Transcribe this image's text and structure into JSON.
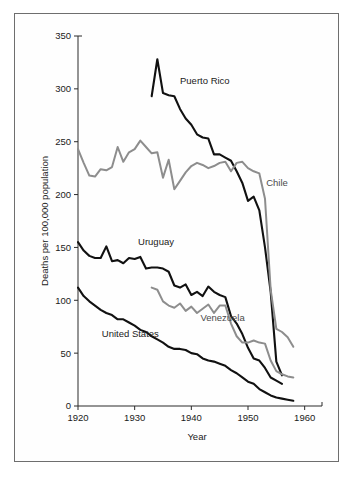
{
  "chart_data": {
    "type": "line",
    "title": "",
    "xlabel": "Year",
    "ylabel": "Deaths per 100,000 population",
    "xlim": [
      1920,
      1962
    ],
    "ylim": [
      0,
      350
    ],
    "xticks": [
      "1920",
      "1930",
      "1940",
      "1950",
      "1960"
    ],
    "xtick_values": [
      1920,
      1930,
      1940,
      1950,
      1960
    ],
    "yticks": [
      "0",
      "50",
      "100",
      "150",
      "200",
      "250",
      "300",
      "350"
    ],
    "ytick_values": [
      0,
      50,
      100,
      150,
      200,
      250,
      300,
      350
    ],
    "grid": false,
    "legend_position": "inline-annotations",
    "annotations": [
      {
        "text": "Puerto Rico",
        "x": 1938.0,
        "y": 305
      },
      {
        "text": "Chile",
        "x": 1953.2,
        "y": 208
      },
      {
        "text": "Uruguay",
        "x": 1930.6,
        "y": 152
      },
      {
        "text": "Venezuela",
        "x": 1941.6,
        "y": 80
      },
      {
        "text": "United States",
        "x": 1924.2,
        "y": 65
      }
    ],
    "series": [
      {
        "name": "Puerto Rico",
        "color": "#111111",
        "x": [
          1933,
          1934,
          1935,
          1936,
          1937,
          1938,
          1939,
          1940,
          1941,
          1942,
          1943,
          1944,
          1945,
          1946,
          1947,
          1948,
          1949,
          1950,
          1951,
          1952,
          1953,
          1954,
          1955,
          1956
        ],
        "values": [
          293,
          328,
          296,
          294,
          293,
          281,
          272,
          266,
          257,
          254,
          253,
          238,
          238,
          235,
          232,
          222,
          211,
          194,
          198,
          185,
          150,
          108,
          42,
          29
        ]
      },
      {
        "name": "Chile",
        "color": "#8d8d8d",
        "x": [
          1920,
          1921,
          1922,
          1923,
          1924,
          1925,
          1926,
          1927,
          1928,
          1929,
          1930,
          1931,
          1932,
          1933,
          1934,
          1935,
          1936,
          1937,
          1938,
          1939,
          1940,
          1941,
          1942,
          1943,
          1944,
          1945,
          1946,
          1947,
          1948,
          1949,
          1950,
          1951,
          1952,
          1953,
          1954,
          1955,
          1956,
          1957,
          1958
        ],
        "values": [
          243,
          230,
          218,
          217,
          224,
          223,
          226,
          245,
          231,
          240,
          243,
          251,
          245,
          239,
          240,
          216,
          233,
          205,
          213,
          221,
          227,
          230,
          228,
          225,
          227,
          230,
          231,
          222,
          230,
          231,
          225,
          222,
          220,
          196,
          110,
          73,
          70,
          65,
          56
        ]
      },
      {
        "name": "Uruguay",
        "color": "#111111",
        "x": [
          1920,
          1921,
          1922,
          1923,
          1924,
          1925,
          1926,
          1927,
          1928,
          1929,
          1930,
          1931,
          1932,
          1933,
          1934,
          1935,
          1936,
          1937,
          1938,
          1939,
          1940,
          1941,
          1942,
          1943,
          1944,
          1945,
          1946,
          1947,
          1948,
          1949,
          1950,
          1951,
          1952,
          1953,
          1954,
          1955,
          1956
        ],
        "values": [
          155,
          147,
          142,
          140,
          140,
          151,
          137,
          138,
          135,
          140,
          139,
          141,
          130,
          131,
          131,
          130,
          127,
          114,
          112,
          115,
          105,
          108,
          104,
          113,
          108,
          105,
          103,
          85,
          78,
          68,
          55,
          45,
          43,
          36,
          27,
          24,
          21
        ]
      },
      {
        "name": "Venezuela",
        "color": "#8d8d8d",
        "x": [
          1933,
          1934,
          1935,
          1936,
          1937,
          1938,
          1939,
          1940,
          1941,
          1942,
          1943,
          1944,
          1945,
          1946,
          1947,
          1948,
          1949,
          1950,
          1951,
          1952,
          1953,
          1954,
          1955,
          1956,
          1957,
          1958
        ],
        "values": [
          112,
          110,
          99,
          95,
          93,
          97,
          90,
          94,
          88,
          92,
          96,
          88,
          95,
          95,
          78,
          66,
          60,
          60,
          62,
          60,
          59,
          43,
          33,
          30,
          28,
          27
        ]
      },
      {
        "name": "United States",
        "color": "#111111",
        "x": [
          1920,
          1921,
          1922,
          1923,
          1924,
          1925,
          1926,
          1927,
          1928,
          1929,
          1930,
          1931,
          1932,
          1933,
          1934,
          1935,
          1936,
          1937,
          1938,
          1939,
          1940,
          1941,
          1942,
          1943,
          1944,
          1945,
          1946,
          1947,
          1948,
          1949,
          1950,
          1951,
          1952,
          1953,
          1954,
          1955,
          1956,
          1957,
          1958
        ],
        "values": [
          112,
          104,
          99,
          95,
          91,
          88,
          86,
          82,
          82,
          79,
          76,
          72,
          70,
          66,
          63,
          60,
          56,
          54,
          54,
          53,
          50,
          49,
          45,
          43,
          42,
          40,
          38,
          34,
          31,
          27,
          23,
          21,
          16,
          13,
          10,
          8,
          7,
          6,
          5
        ]
      }
    ]
  }
}
